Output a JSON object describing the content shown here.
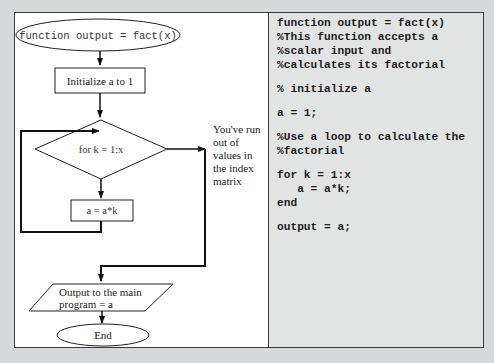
{
  "flowchart": {
    "start": "function output = fact(x)",
    "init": "Initialize a to 1",
    "decision": "for k = 1:x",
    "body": "a = a*k",
    "exit_note": [
      "You've run",
      "out of",
      "values in",
      "the index",
      "matrix"
    ],
    "output": [
      "Output to the main",
      "program = a"
    ],
    "end": "End"
  },
  "code": {
    "lines": [
      "function output = fact(x)",
      "%This function accepts a",
      "%scalar input and",
      "%calculates its factorial",
      "",
      "% initialize a",
      "",
      "a = 1;",
      "",
      "%Use a loop to calculate the",
      "%factorial",
      "",
      "for k = 1:x",
      "   a = a*k;",
      "end",
      "",
      "output = a;"
    ]
  }
}
